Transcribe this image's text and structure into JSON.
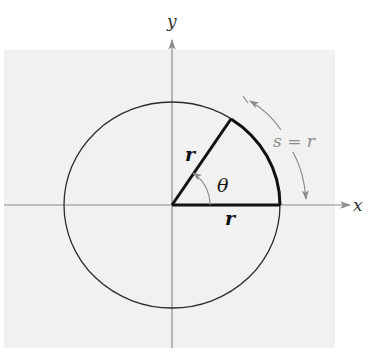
{
  "diagram": {
    "colors": {
      "background_panel": "#f1f1f1",
      "ink": "#1e1e1e",
      "annotation": "#8c8c8c"
    },
    "labels": {
      "x_axis": "x",
      "y_axis": "y",
      "radius_terminal": "r",
      "radius_initial": "r",
      "angle": "θ",
      "arc_relation": "s = r"
    },
    "geometry": {
      "origin": [
        172,
        205
      ],
      "circle_rx": 108,
      "circle_ry": 103,
      "angle_degrees": 57.3
    }
  }
}
